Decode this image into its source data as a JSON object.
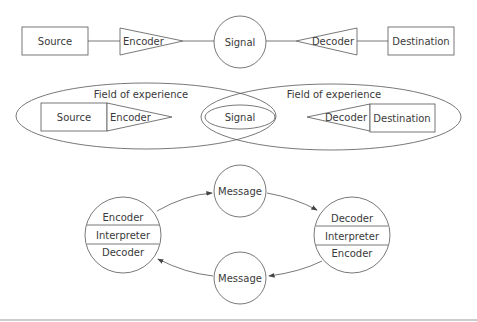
{
  "diagram": {
    "row1": {
      "source": "Source",
      "encoder": "Encoder",
      "signal": "Signal",
      "decoder": "Decoder",
      "destination": "Destination"
    },
    "row2": {
      "left_field": "Field of experience",
      "right_field": "Field of experience",
      "source": "Source",
      "encoder": "Encoder",
      "signal": "Signal",
      "decoder": "Decoder",
      "destination": "Destination"
    },
    "row3": {
      "left_node": [
        "Encoder",
        "Interpreter",
        "Decoder"
      ],
      "right_node": [
        "Decoder",
        "Interpreter",
        "Encoder"
      ],
      "message_top": "Message",
      "message_bottom": "Message"
    }
  },
  "colors": {
    "stroke": "#555555",
    "text": "#3a3a3a",
    "background": "#ffffff"
  }
}
